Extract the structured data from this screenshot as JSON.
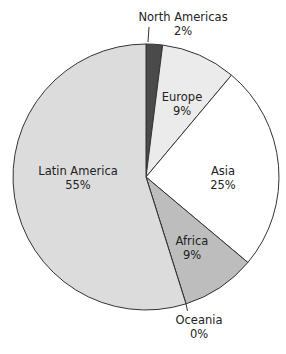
{
  "chart_data": {
    "type": "pie",
    "title": "",
    "categories": [
      "North Americas",
      "Europe",
      "Asia",
      "Africa",
      "Oceania",
      "Latin America"
    ],
    "values": [
      2,
      9,
      25,
      9,
      0,
      55
    ],
    "value_labels": [
      "2%",
      "9%",
      "25%",
      "9%",
      "0%",
      "55%"
    ],
    "colors": [
      "#4a4a4a",
      "#ebebeb",
      "#ffffff",
      "#bdbdbd",
      "#bdbdbd",
      "#dcdcdc"
    ],
    "start_angle_deg_from_top": 0,
    "direction": "clockwise",
    "legend": "none",
    "labels_inside": [
      "Europe",
      "Asia",
      "Africa",
      "Latin America"
    ],
    "labels_outside_with_leader": [
      "North Americas",
      "Oceania"
    ]
  },
  "labels": {
    "north_americas": {
      "name": "North Americas",
      "pct": "2%"
    },
    "europe": {
      "name": "Europe",
      "pct": "9%"
    },
    "asia": {
      "name": "Asia",
      "pct": "25%"
    },
    "africa": {
      "name": "Africa",
      "pct": "9%"
    },
    "oceania": {
      "name": "Oceania",
      "pct": "0%"
    },
    "latin_america": {
      "name": "Latin America",
      "pct": "55%"
    }
  }
}
